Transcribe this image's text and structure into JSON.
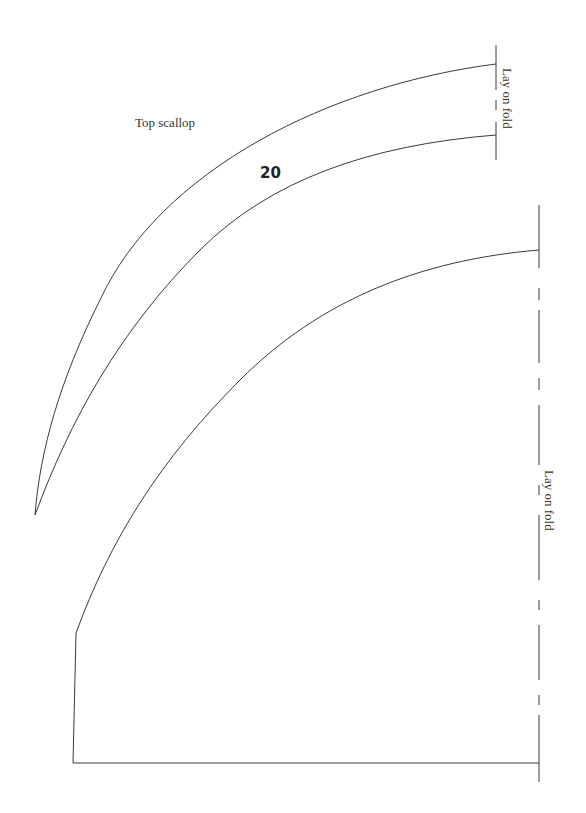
{
  "top_piece": {
    "title": "Top scallop",
    "piece_number": "20",
    "fold_label": "Lay on fold"
  },
  "bottom_piece": {
    "fold_label": "Lay on fold"
  },
  "colors": {
    "line": "#3a3a3a",
    "background": "#ffffff"
  }
}
